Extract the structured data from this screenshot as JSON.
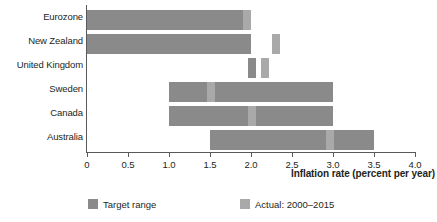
{
  "chart_data": {
    "type": "bar",
    "title": "",
    "subtitle": "",
    "xlabel": "Inflation rate (percent per year)",
    "ylabel": "",
    "xlim": [
      0,
      4.0
    ],
    "xticks": [
      0,
      0.5,
      1.0,
      1.5,
      2.0,
      2.5,
      3.0,
      3.5,
      4.0
    ],
    "xtick_labels": [
      "0",
      "0.5",
      "1.0",
      "1.5",
      "2.0",
      "2.5",
      "3.0",
      "3.5",
      "4.0"
    ],
    "grid": false,
    "orientation": "horizontal",
    "legend_position": "bottom",
    "categories": [
      "Eurozone",
      "New Zealand",
      "United Kingdom",
      "Sweden",
      "Canada",
      "Australia"
    ],
    "series": [
      {
        "name": "Target range",
        "color": "#8a8a8a",
        "values": [
          {
            "category": "Eurozone",
            "start": 0.0,
            "end": 2.0
          },
          {
            "category": "New Zealand",
            "start": 0.0,
            "end": 2.0
          },
          {
            "category": "United Kingdom",
            "start": 1.96,
            "end": 2.06
          },
          {
            "category": "Sweden",
            "start": 1.0,
            "end": 3.0
          },
          {
            "category": "Canada",
            "start": 1.0,
            "end": 3.0
          },
          {
            "category": "Australia",
            "start": 1.5,
            "end": 3.5
          }
        ]
      },
      {
        "name": "Actual: 2000–2015",
        "color": "#a9a9a9",
        "values": [
          {
            "category": "Eurozone",
            "start": 1.9,
            "end": 2.0
          },
          {
            "category": "New Zealand",
            "start": 2.25,
            "end": 2.35
          },
          {
            "category": "United Kingdom",
            "start": 2.12,
            "end": 2.22
          },
          {
            "category": "Sweden",
            "start": 1.46,
            "end": 1.56
          },
          {
            "category": "Canada",
            "start": 1.96,
            "end": 2.06
          },
          {
            "category": "Australia",
            "start": 2.91,
            "end": 3.01
          }
        ]
      }
    ]
  },
  "legend": {
    "items": [
      {
        "label": "Target range",
        "color": "#8a8a8a"
      },
      {
        "label": "Actual: 2000–2015",
        "color": "#a9a9a9"
      }
    ]
  },
  "colors": {
    "target_range": "#8a8a8a",
    "actual": "#a9a9a9",
    "axis": "#58595b",
    "text": "#231f20",
    "background": "#ffffff"
  }
}
